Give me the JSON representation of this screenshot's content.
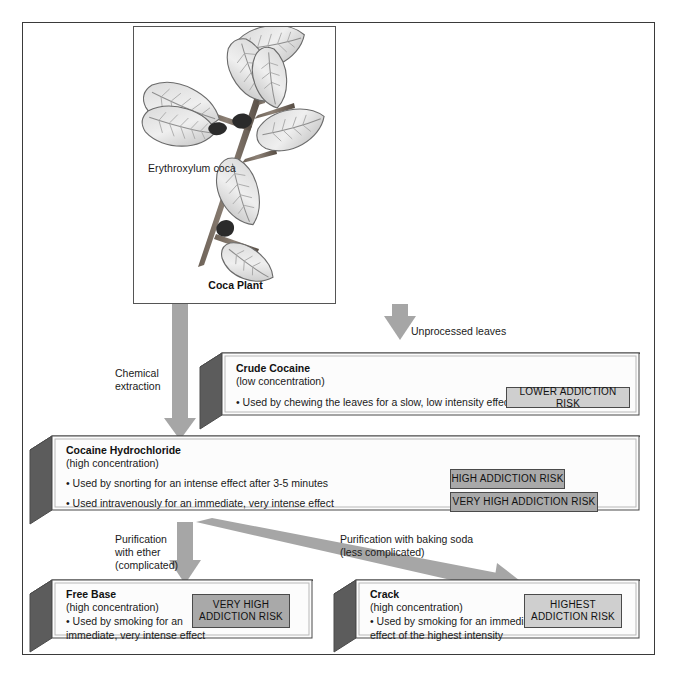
{
  "diagram": {
    "plant_panel": {
      "scientific_name": "Erythroxylum coca",
      "caption": "Coca Plant",
      "icon": "coca-plant-illustration"
    },
    "arrow_labels": {
      "unprocessed": "Unprocessed leaves",
      "chemical_extraction": "Chemical\nextraction",
      "purification_ether": "Purification\nwith ether\n(complicated)",
      "purification_soda": "Purification with baking soda\n(less complicated)"
    },
    "boxes": [
      {
        "id": "crude-cocaine",
        "title": "Crude Cocaine",
        "subtitle": "(low concentration)",
        "bullets": [
          "• Used by chewing the leaves for a slow, low intensity effect"
        ],
        "badges": [
          {
            "label": "LOWER ADDICTION RISK",
            "level": "lower",
            "tone": "light"
          }
        ]
      },
      {
        "id": "cocaine-hydrochloride",
        "title": "Cocaine Hydrochloride",
        "subtitle": "(high concentration)",
        "bullets": [
          "• Used by snorting for an intense effect after 3-5 minutes",
          "• Used intravenously for an immediate, very intense effect"
        ],
        "badges": [
          {
            "label": "HIGH ADDICTION RISK",
            "level": "high",
            "tone": "mid"
          },
          {
            "label": "VERY HIGH ADDICTION RISK",
            "level": "very-high",
            "tone": "mid"
          }
        ]
      },
      {
        "id": "free-base",
        "title": "Free Base",
        "subtitle": "(high concentration)",
        "bullets": [
          "• Used by smoking for an",
          "   immediate, very intense effect"
        ],
        "badges": [
          {
            "label": "VERY HIGH\nADDICTION RISK",
            "level": "very-high",
            "tone": "mid"
          }
        ]
      },
      {
        "id": "crack",
        "title": "Crack",
        "subtitle": "(high concentration)",
        "bullets": [
          "• Used by smoking for an immediate",
          "   effect of the highest intensity"
        ],
        "badges": [
          {
            "label": "HIGHEST\nADDICTION RISK",
            "level": "highest",
            "tone": "light"
          }
        ]
      }
    ],
    "colors": {
      "arrow_fill": "#a6a6a6",
      "box_face": "#fcfcfc",
      "box_side_dark": "#5c5c5c",
      "box_top": "#a9a9a9",
      "badge_light": "#cfcfcf",
      "badge_mid": "#a9a9a9",
      "frame": "#3a3a3a"
    }
  }
}
